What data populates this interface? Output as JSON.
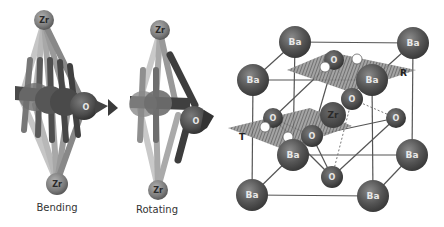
{
  "panels": {
    "bending": {
      "caption": "Bending",
      "top_atom": "Zr",
      "bottom_atom": "Zr",
      "center_atom": "O"
    },
    "rotating": {
      "caption": "Rotating",
      "top_atom": "Zr",
      "bottom_atom": "Zr",
      "center_atom": "O"
    },
    "unit_cell": {
      "corner_atom": "Ba",
      "center_atom": "Zr",
      "face_atom": "O",
      "plane_labels": {
        "upper": "R",
        "lower": "T"
      }
    }
  },
  "colors": {
    "atom_dark": "#4d4d4d",
    "atom_mid": "#707070",
    "zr_light": "#8a8a8a",
    "bond": "#555555",
    "bond_light": "#b8b8b8",
    "plane": "#6a6a6a",
    "background": "#ffffff"
  }
}
